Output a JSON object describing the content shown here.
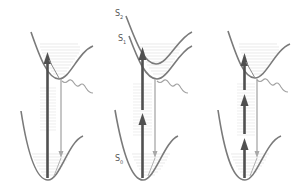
{
  "figure": {
    "colors": {
      "curve": "#808080",
      "arrow_up": "#555555",
      "arrow_down": "#aaaaaa",
      "levels": "#d8d8d8",
      "wavy": "#a0a0a0"
    },
    "labels": {
      "s2": "S",
      "s2_sub": "2",
      "s1": "S",
      "s1_sub": "1",
      "s0": "S",
      "s0_sub": "0"
    },
    "panels": [
      {
        "name": "one-photon",
        "up_arrows": 1,
        "offset_x": 0
      },
      {
        "name": "two-photon",
        "up_arrows": 2,
        "offset_x": 101
      },
      {
        "name": "three-photon",
        "up_arrows": 3,
        "offset_x": 205
      }
    ]
  }
}
